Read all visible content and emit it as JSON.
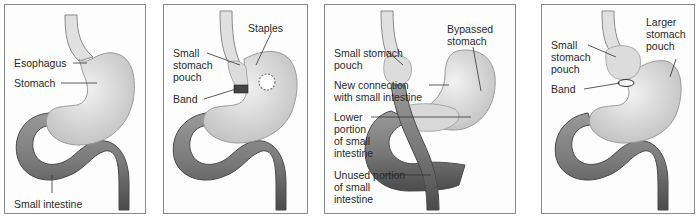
{
  "figure": {
    "panels": [
      {
        "id": "normal",
        "labels": {
          "esophagus": "Esophagus",
          "stomach": "Stomach",
          "small_intestine": "Small intestine"
        }
      },
      {
        "id": "vertical-banded-gastroplasty",
        "labels": {
          "staples": "Staples",
          "small_stomach_pouch": "Small stomach pouch",
          "band": "Band"
        }
      },
      {
        "id": "gastric-bypass",
        "labels": {
          "bypassed_stomach": "Bypassed stomach",
          "small_stomach_pouch": "Small stomach pouch",
          "new_connection": "New connection with small intestine",
          "lower_portion": "Lower portion of small intestine",
          "unused_portion": "Unused portion of small intestine"
        }
      },
      {
        "id": "adjustable-gastric-banding",
        "labels": {
          "larger_pouch": "Larger stomach pouch",
          "small_stomach_pouch": "Small stomach pouch",
          "band": "Band"
        }
      }
    ],
    "colors": {
      "stomach_fill": "#e4e4e4",
      "stomach_shade": "#c9c9c9",
      "intestine_fill": "#8a8a8a",
      "intestine_dark": "#555555",
      "border": "#8a8a8a",
      "leader_line": "#333333"
    }
  }
}
